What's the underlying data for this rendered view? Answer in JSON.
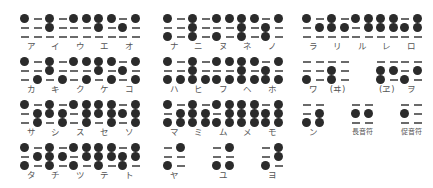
{
  "colors": {
    "dot": "#2b2b2b",
    "empty_dash": "#6a6a6a",
    "label": "#555555",
    "background": "#ffffff"
  },
  "legend": {
    "dot_order": "each cell = 3 rows x 2 columns, row-major [r1-left, r1-right, r2-left, r2-right, r3-left, r3-right]; 1 = raised dot, 0 = dash (no dot)"
  },
  "groups": [
    {
      "name": "group-a-ta",
      "rows": [
        {
          "cells": [
            {
              "col": 0,
              "label": "ア",
              "dots": [
                1,
                0,
                0,
                0,
                0,
                0
              ]
            },
            {
              "col": 1,
              "label": "イ",
              "dots": [
                1,
                0,
                1,
                0,
                0,
                0
              ]
            },
            {
              "col": 2,
              "label": "ウ",
              "dots": [
                1,
                1,
                0,
                0,
                0,
                0
              ]
            },
            {
              "col": 3,
              "label": "エ",
              "dots": [
                1,
                1,
                1,
                0,
                0,
                0
              ]
            },
            {
              "col": 4,
              "label": "オ",
              "dots": [
                0,
                1,
                1,
                0,
                0,
                0
              ]
            }
          ]
        },
        {
          "cells": [
            {
              "col": 0,
              "label": "カ",
              "dots": [
                1,
                0,
                0,
                0,
                0,
                1
              ]
            },
            {
              "col": 1,
              "label": "キ",
              "dots": [
                1,
                0,
                1,
                0,
                0,
                1
              ]
            },
            {
              "col": 2,
              "label": "ク",
              "dots": [
                1,
                1,
                0,
                0,
                0,
                1
              ]
            },
            {
              "col": 3,
              "label": "ケ",
              "dots": [
                1,
                1,
                1,
                0,
                0,
                1
              ]
            },
            {
              "col": 4,
              "label": "コ",
              "dots": [
                0,
                1,
                1,
                0,
                0,
                1
              ]
            }
          ]
        },
        {
          "cells": [
            {
              "col": 0,
              "label": "サ",
              "dots": [
                1,
                0,
                0,
                1,
                0,
                1
              ]
            },
            {
              "col": 1,
              "label": "シ",
              "dots": [
                1,
                0,
                1,
                1,
                0,
                1
              ]
            },
            {
              "col": 2,
              "label": "ス",
              "dots": [
                1,
                1,
                0,
                1,
                0,
                1
              ]
            },
            {
              "col": 3,
              "label": "セ",
              "dots": [
                1,
                1,
                1,
                1,
                0,
                1
              ]
            },
            {
              "col": 4,
              "label": "ソ",
              "dots": [
                0,
                1,
                1,
                1,
                0,
                1
              ]
            }
          ]
        },
        {
          "cells": [
            {
              "col": 0,
              "label": "タ",
              "dots": [
                1,
                0,
                0,
                1,
                1,
                0
              ]
            },
            {
              "col": 1,
              "label": "チ",
              "dots": [
                1,
                0,
                1,
                1,
                1,
                0
              ]
            },
            {
              "col": 2,
              "label": "ツ",
              "dots": [
                1,
                1,
                0,
                1,
                1,
                0
              ]
            },
            {
              "col": 3,
              "label": "テ",
              "dots": [
                1,
                1,
                1,
                1,
                1,
                0
              ]
            },
            {
              "col": 4,
              "label": "ト",
              "dots": [
                0,
                1,
                1,
                1,
                1,
                0
              ]
            }
          ]
        }
      ]
    },
    {
      "name": "group-na-ya",
      "rows": [
        {
          "cells": [
            {
              "col": 0,
              "label": "ナ",
              "dots": [
                1,
                0,
                0,
                0,
                1,
                0
              ]
            },
            {
              "col": 1,
              "label": "ニ",
              "dots": [
                1,
                0,
                1,
                0,
                1,
                0
              ]
            },
            {
              "col": 2,
              "label": "ヌ",
              "dots": [
                1,
                1,
                0,
                0,
                1,
                0
              ]
            },
            {
              "col": 3,
              "label": "ネ",
              "dots": [
                1,
                1,
                1,
                0,
                1,
                0
              ]
            },
            {
              "col": 4,
              "label": "ノ",
              "dots": [
                0,
                1,
                1,
                0,
                1,
                0
              ]
            }
          ]
        },
        {
          "cells": [
            {
              "col": 0,
              "label": "ハ",
              "dots": [
                1,
                0,
                0,
                0,
                1,
                1
              ]
            },
            {
              "col": 1,
              "label": "ヒ",
              "dots": [
                1,
                0,
                1,
                0,
                1,
                1
              ]
            },
            {
              "col": 2,
              "label": "フ",
              "dots": [
                1,
                1,
                0,
                0,
                1,
                1
              ]
            },
            {
              "col": 3,
              "label": "ヘ",
              "dots": [
                1,
                1,
                1,
                0,
                1,
                1
              ]
            },
            {
              "col": 4,
              "label": "ホ",
              "dots": [
                0,
                1,
                1,
                0,
                1,
                1
              ]
            }
          ]
        },
        {
          "cells": [
            {
              "col": 0,
              "label": "マ",
              "dots": [
                1,
                0,
                0,
                1,
                1,
                1
              ]
            },
            {
              "col": 1,
              "label": "ミ",
              "dots": [
                1,
                0,
                1,
                1,
                1,
                1
              ]
            },
            {
              "col": 2,
              "label": "ム",
              "dots": [
                1,
                1,
                0,
                1,
                1,
                1
              ]
            },
            {
              "col": 3,
              "label": "メ",
              "dots": [
                1,
                1,
                1,
                1,
                1,
                1
              ]
            },
            {
              "col": 4,
              "label": "モ",
              "dots": [
                0,
                1,
                1,
                1,
                1,
                1
              ]
            }
          ]
        },
        {
          "cells": [
            {
              "col": 0,
              "label": "ヤ",
              "dots": [
                0,
                1,
                0,
                0,
                1,
                0
              ]
            },
            {
              "col": 2,
              "label": "ユ",
              "dots": [
                0,
                1,
                0,
                0,
                1,
                1
              ]
            },
            {
              "col": 4,
              "label": "ヨ",
              "dots": [
                0,
                1,
                0,
                1,
                1,
                0
              ]
            }
          ]
        }
      ]
    },
    {
      "name": "group-ra-n",
      "rows": [
        {
          "cells": [
            {
              "col": 0,
              "label": "ラ",
              "dots": [
                1,
                0,
                0,
                1,
                0,
                0
              ]
            },
            {
              "col": 1,
              "label": "リ",
              "dots": [
                1,
                0,
                1,
                1,
                0,
                0
              ]
            },
            {
              "col": 2,
              "label": "ル",
              "dots": [
                1,
                1,
                0,
                1,
                0,
                0
              ]
            },
            {
              "col": 3,
              "label": "レ",
              "dots": [
                1,
                1,
                1,
                1,
                0,
                0
              ]
            },
            {
              "col": 4,
              "label": "ロ",
              "dots": [
                0,
                1,
                1,
                1,
                0,
                0
              ]
            }
          ]
        },
        {
          "cells": [
            {
              "col": 0,
              "label": "ワ",
              "dots": [
                0,
                0,
                0,
                0,
                1,
                0
              ]
            },
            {
              "col": 1,
              "label": "(ヰ)",
              "dots": [
                0,
                0,
                1,
                0,
                1,
                0
              ]
            },
            {
              "col": 3,
              "label": "(ヱ)",
              "dots": [
                0,
                0,
                1,
                1,
                1,
                0
              ]
            },
            {
              "col": 4,
              "label": "ヲ",
              "dots": [
                0,
                0,
                0,
                1,
                1,
                0
              ]
            }
          ]
        },
        {
          "cells": [
            {
              "col": 0,
              "label": "ン",
              "dots": [
                0,
                0,
                0,
                1,
                1,
                1
              ]
            },
            {
              "col": 2,
              "label": "長音符",
              "dots": [
                0,
                0,
                1,
                1,
                0,
                0
              ],
              "small": true
            },
            {
              "col": 4,
              "label": "促音符",
              "dots": [
                0,
                0,
                1,
                0,
                0,
                0
              ],
              "small": true
            }
          ]
        }
      ]
    }
  ]
}
